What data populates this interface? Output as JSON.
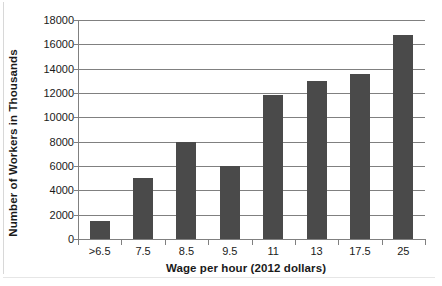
{
  "chart_data": {
    "type": "bar",
    "title": "",
    "xlabel": "Wage per hour (2012 dollars)",
    "ylabel": "Number of Workers in Thousands",
    "categories": [
      ">6.5",
      "7.5",
      "8.5",
      "9.5",
      "11",
      "13",
      "17.5",
      "25"
    ],
    "values": [
      1500,
      5000,
      8000,
      6000,
      11800,
      13000,
      13600,
      16800
    ],
    "ylim": [
      0,
      18000
    ],
    "ytick_step": 2000,
    "ytick_labels": [
      "0",
      "2000",
      "4000",
      "6000",
      "8000",
      "10000",
      "12000",
      "14000",
      "16000",
      "18000"
    ],
    "grid": true,
    "grid_axis": "y",
    "legend": false,
    "legend_position": "none",
    "bar_color": "#4a4a4a",
    "grid_color": "#808080",
    "axis_color": "#808080",
    "background_color": "#ffffff",
    "text_color": "#1a1a1a"
  }
}
